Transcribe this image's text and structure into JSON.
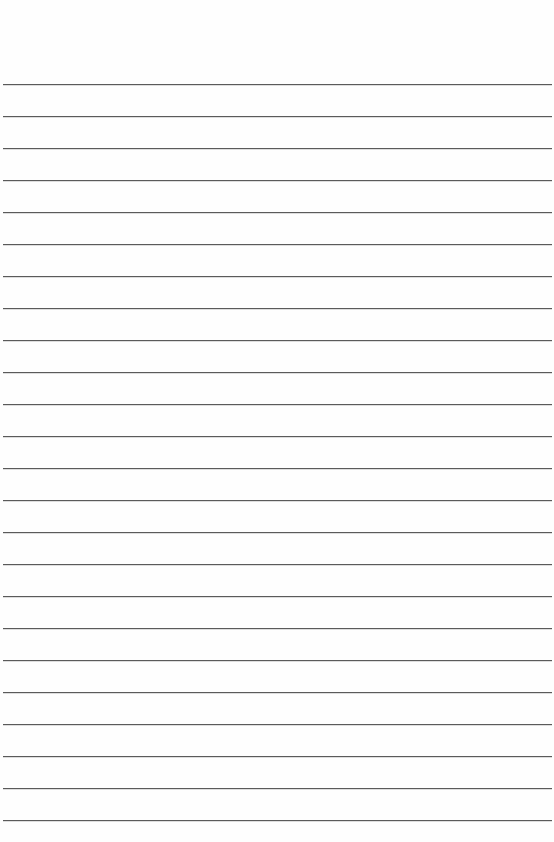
{
  "page": {
    "type": "lined-paper",
    "background_color": "#fefefe",
    "line_color": "#5a5a5a",
    "line_count": 24,
    "first_line_y": 84,
    "line_spacing": 32,
    "line_left": 3,
    "line_width": 549,
    "text": ""
  }
}
